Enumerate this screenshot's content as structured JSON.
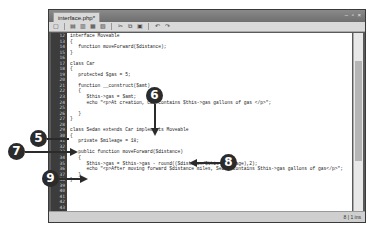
{
  "window": {
    "tab_title": "interface.php*",
    "window_controls": "– ▫ ×"
  },
  "toolbar": {
    "icons": [
      "new-file-icon",
      "open-icon",
      "save-icon",
      "save-all-icon",
      "close-icon",
      "cut-icon",
      "copy-icon",
      "paste-icon",
      "undo-icon",
      "redo-icon"
    ],
    "glyphs": [
      "▢",
      "▤",
      "▥",
      "▦",
      "▧",
      "✂",
      "⧉",
      "▣",
      "↶",
      "↷"
    ]
  },
  "editor": {
    "line_numbers": [
      "12",
      "13",
      "14",
      "15",
      "16",
      "17",
      "18",
      "19",
      "20",
      "21",
      "22",
      "23",
      "24",
      "25",
      "26",
      "27",
      "28",
      "29",
      "30",
      "31",
      "32",
      "33",
      "34",
      "35",
      "36",
      "37",
      "38",
      "39",
      "40",
      "41",
      "42",
      "43"
    ],
    "lines": [
      "interface Moveable",
      "{",
      "   function moveForward($distance);",
      "}",
      "",
      "class Car",
      "{",
      "   protected $gas = 5;",
      "",
      "   function __construct($amt)",
      "   {",
      "      $this->gas = $amt;",
      "      echo \"<p>At creation, Car contains $this->gas gallons of gas </p>\";",
      "",
      "   }",
      "}",
      "",
      "class Sedan extends Car implements Moveable",
      "{",
      "   private $mileage = 18;",
      "",
      "   public function moveForward($distance)",
      "   {",
      "      $this->gas = $this->gas - round(($distance/$this->mileage),2);",
      "      echo \"<p>After moving forward $distance miles, Sedan contains $this->gas gallons of gas</p>\";",
      "   }",
      "}",
      "",
      "",
      "",
      "",
      ""
    ]
  },
  "statusbar": {
    "position": "8 | 1 ins"
  },
  "callouts": {
    "c5": "5",
    "c6": "6",
    "c7": "7",
    "c8": "8",
    "c9": "9"
  }
}
